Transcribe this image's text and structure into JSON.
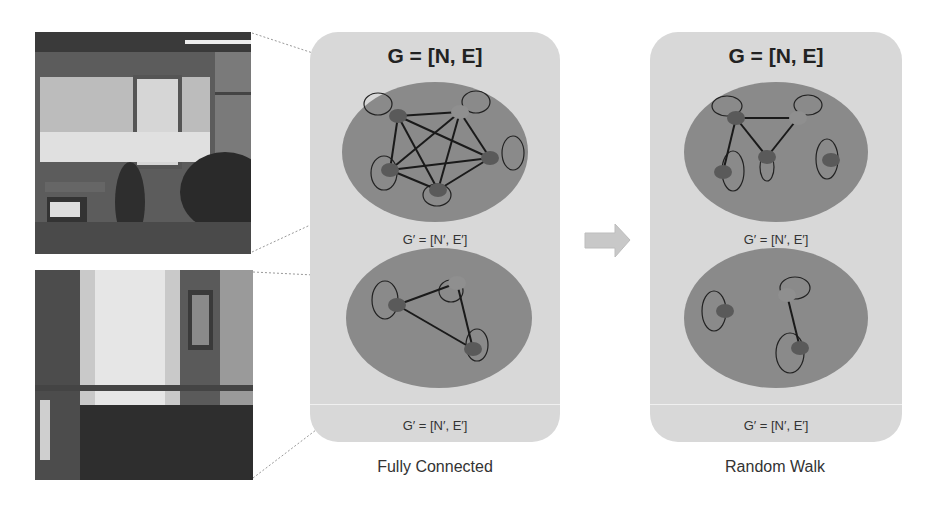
{
  "panels": [
    {
      "id": "fully-connected",
      "title": "G = [N, E]",
      "subgraph_label_top": "G′ = [N′, E′]",
      "subgraph_label_bottom": "G′ = [N′, E′]",
      "caption": "Fully Connected"
    },
    {
      "id": "random-walk",
      "title": "G = [N, E]",
      "subgraph_label_top": "G′ = [N′, E′]",
      "subgraph_label_bottom": "G′ = [N′, E′]",
      "caption": "Random Walk"
    }
  ],
  "images": [
    {
      "name": "garage-photo",
      "description": "garage with motorcycles"
    },
    {
      "name": "bedroom-photo",
      "description": "bedroom with curtains and bed"
    }
  ],
  "arrow": {
    "direction": "right"
  },
  "colors": {
    "panel_bg": "#d8d8d8",
    "ellipse": "#8a8a8a",
    "node_dark": "#5a5a5a",
    "node_light": "#8f8f8f",
    "edge": "#1a1a1a"
  }
}
